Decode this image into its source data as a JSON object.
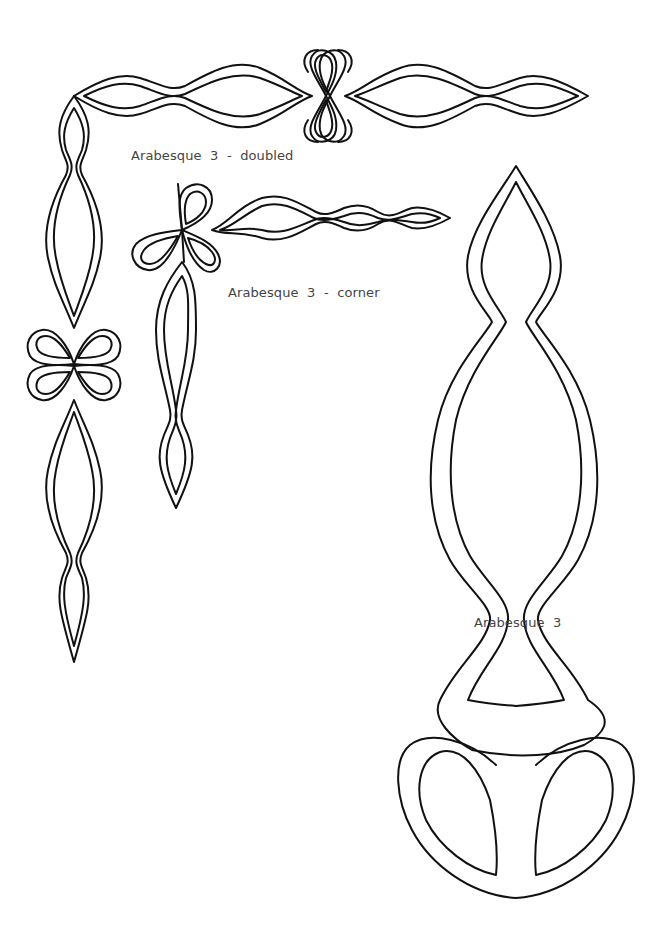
{
  "page": {
    "background": "#ffffff",
    "stroke_color": "#111111",
    "label_color": "#444444"
  },
  "labels": {
    "doubled": "Arabesque  3  -  doubled",
    "corner": "Arabesque  3  -  corner",
    "single": "Arabesque  3"
  },
  "ornaments": [
    {
      "name": "Arabesque 3 - doubled",
      "type": "L-shaped double border with two bow knots"
    },
    {
      "name": "Arabesque 3 - corner",
      "type": "corner piece with bow knot"
    },
    {
      "name": "Arabesque 3",
      "type": "single large vertical arabesque with bow base"
    }
  ]
}
